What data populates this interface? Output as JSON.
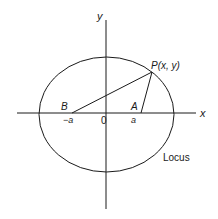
{
  "diagram": {
    "axes": {
      "x_label": "x",
      "y_label": "y",
      "origin_label": "0"
    },
    "points": {
      "A": {
        "label": "A",
        "tick_label": "a"
      },
      "B": {
        "label": "B",
        "tick_label": "−a"
      },
      "P": {
        "label": "P(x, y)"
      }
    },
    "curve": {
      "label": "Locus",
      "shape": "ellipse"
    },
    "colors": {
      "stroke": "#1a1a1a",
      "background": "#ffffff"
    }
  }
}
